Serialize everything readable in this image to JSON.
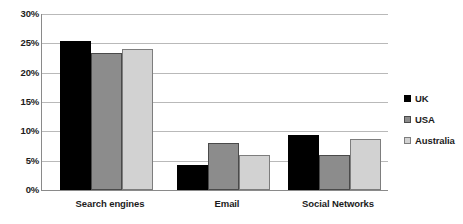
{
  "chart_data": {
    "type": "bar",
    "title": "",
    "subtitle": "",
    "xlabel": "",
    "ylabel": "",
    "categories": [
      "Search engines",
      "Email",
      "Social Networks"
    ],
    "series": [
      {
        "name": "UK",
        "color": "#000000",
        "values": [
          25.4,
          4.2,
          9.3
        ]
      },
      {
        "name": "USA",
        "color": "#8c8c8c",
        "values": [
          23.3,
          8.0,
          6.0
        ]
      },
      {
        "name": "Australia",
        "color": "#d2d2d2",
        "values": [
          24.0,
          6.0,
          8.7
        ]
      }
    ],
    "ylim": [
      0,
      30
    ],
    "ytick_values": [
      0,
      5,
      10,
      15,
      20,
      25,
      30
    ],
    "ytick_labels": [
      "0%",
      "5%",
      "10%",
      "15%",
      "20%",
      "25%",
      "30%"
    ],
    "grid": true,
    "grid_axis": "y",
    "legend_position": "right",
    "value_suffix": "%"
  },
  "legend": {
    "items": [
      {
        "label": "UK",
        "swatch": "uk"
      },
      {
        "label": "USA",
        "swatch": "usa"
      },
      {
        "label": "Australia",
        "swatch": "aus"
      }
    ]
  }
}
